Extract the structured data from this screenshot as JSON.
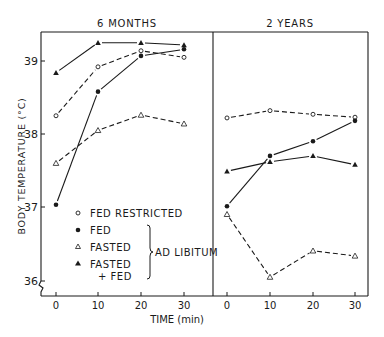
{
  "chart_data": {
    "type": "line",
    "ylabel": "BODY TEMPERATURE (°C)",
    "xlabel": "TIME (min)",
    "yticks": [
      "36",
      "37",
      "38",
      "39"
    ],
    "ylim": [
      35.8,
      39.4
    ],
    "xticks": [
      "0",
      "10",
      "20",
      "30"
    ],
    "x": [
      0,
      10,
      20,
      30
    ],
    "grid": false,
    "legend": {
      "position": "lower-left of 6-month panel",
      "items": [
        {
          "label": "FED RESTRICTED",
          "marker": "open-circle",
          "line": "dashed"
        },
        {
          "label": "FED",
          "marker": "filled-circle",
          "line": "solid"
        },
        {
          "label": "FASTED",
          "marker": "open-triangle",
          "line": "dashed"
        },
        {
          "label": "FASTED",
          "label2": "+ FED",
          "marker": "filled-triangle",
          "line": "solid"
        }
      ],
      "group_label": "AD LIBITUM"
    },
    "panels": [
      {
        "title": "6 MONTHS",
        "series": [
          {
            "name": "FED RESTRICTED",
            "values": [
              38.25,
              38.92,
              39.14,
              39.05
            ]
          },
          {
            "name": "FED",
            "values": [
              37.03,
              38.58,
              39.07,
              39.16
            ]
          },
          {
            "name": "FASTED",
            "values": [
              37.6,
              38.05,
              38.26,
              38.14
            ]
          },
          {
            "name": "FASTED + FED",
            "values": [
              38.84,
              39.25,
              39.25,
              39.22
            ]
          }
        ]
      },
      {
        "title": "2 YEARS",
        "series": [
          {
            "name": "FED RESTRICTED",
            "values": [
              38.22,
              38.32,
              38.27,
              38.23
            ]
          },
          {
            "name": "FED",
            "values": [
              37.01,
              37.7,
              37.9,
              38.18
            ]
          },
          {
            "name": "FASTED",
            "values": [
              36.9,
              36.04,
              36.4,
              36.33
            ]
          },
          {
            "name": "FASTED + FED",
            "values": [
              37.49,
              37.62,
              37.7,
              37.58
            ]
          }
        ]
      }
    ]
  },
  "labels": {
    "panel_left_title": "6 MONTHS",
    "panel_right_title": "2 YEARS",
    "ylabel": "BODY TEMPERATURE (°C)",
    "xlabel": "TIME (min)",
    "legend_fed_restricted": "FED RESTRICTED",
    "legend_fed": "FED",
    "legend_fasted": "FASTED",
    "legend_fasted_fed_1": "FASTED",
    "legend_fasted_fed_2": "+ FED",
    "legend_ad_libitum": "AD LIBITUM",
    "ytick_36": "36",
    "ytick_37": "37",
    "ytick_38": "38",
    "ytick_39": "39",
    "xtick_0": "0",
    "xtick_10": "10",
    "xtick_20": "20",
    "xtick_30": "30"
  }
}
